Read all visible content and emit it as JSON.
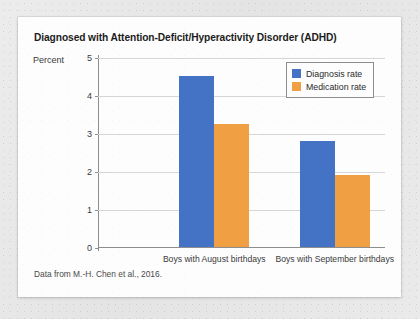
{
  "card": {
    "source_note": "Data from M.-H. Chen et al., 2016."
  },
  "chart_data": {
    "type": "bar",
    "title": "Diagnosed with Attention-Deficit/Hyperactivity Disorder (ADHD)",
    "xlabel": "",
    "ylabel": "Percent",
    "categories": [
      "Boys with August birthdays",
      "Boys with September birthdays"
    ],
    "series": [
      {
        "name": "Diagnosis rate",
        "color": "#4472c4",
        "values": [
          4.5,
          2.8
        ]
      },
      {
        "name": "Medication rate",
        "color": "#f0a043",
        "values": [
          3.25,
          1.9
        ]
      }
    ],
    "ylim": [
      0,
      5
    ],
    "ytick_labels": [
      "5",
      "4",
      "3",
      "2",
      "1",
      "0"
    ],
    "ytick_values": [
      5,
      4,
      3,
      2,
      1,
      0
    ],
    "grid": true,
    "legend_position": "top-right",
    "annotations": []
  }
}
